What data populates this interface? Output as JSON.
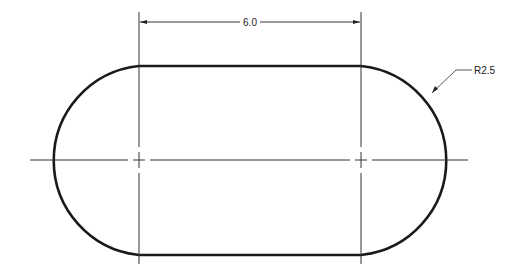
{
  "drawing": {
    "type": "obround-slot",
    "dimensions": {
      "center_distance": "6.0",
      "radius": "R2.5"
    },
    "colors": {
      "outline": "#1a1a1a",
      "thin_line": "#333333",
      "background": "#ffffff"
    }
  }
}
